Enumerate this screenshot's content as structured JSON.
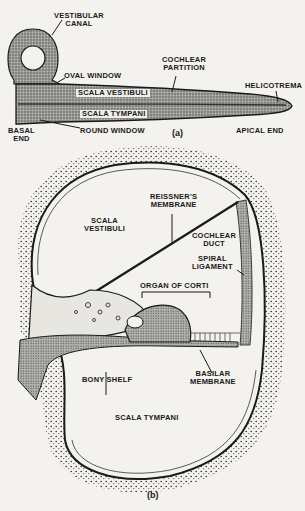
{
  "figure_a": {
    "caption": "(a)",
    "labels": {
      "vestibular_canal_1": "VESTIBULAR",
      "vestibular_canal_2": "CANAL",
      "oval_window": "OVAL WINDOW",
      "cochlear_partition_1": "COCHLEAR",
      "cochlear_partition_2": "PARTITION",
      "scala_vestibuli": "SCALA VESTIBULI",
      "scala_tympani": "SCALA TYMPANI",
      "helicotrema": "HELICOTREMA",
      "basal_end_1": "BASAL",
      "basal_end_2": "END",
      "round_window": "ROUND WINDOW",
      "apical_end": "APICAL END"
    }
  },
  "figure_b": {
    "caption": "(b)",
    "labels": {
      "reissners_1": "REISSNER'S",
      "reissners_2": "MEMBRANE",
      "scala_vestibuli_1": "SCALA",
      "scala_vestibuli_2": "VESTIBULI",
      "cochlear_duct_1": "COCHLEAR",
      "cochlear_duct_2": "DUCT",
      "spiral_ligament_1": "SPIRAL",
      "spiral_ligament_2": "LIGAMENT",
      "organ_of_corti": "ORGAN OF CORTI",
      "bony_shelf": "BONY SHELF",
      "basilar_1": "BASILAR",
      "basilar_2": "MEMBRANE",
      "scala_tympani": "SCALA TYMPANI"
    }
  },
  "colors": {
    "background": "#f4f2ee",
    "ink": "#1a1a1a",
    "stipple_fill": "#8a8a86"
  }
}
